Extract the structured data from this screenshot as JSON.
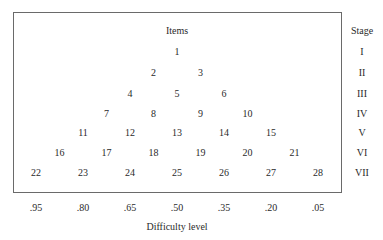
{
  "diagram": {
    "items_header": "Items",
    "stage_header": "Stage",
    "xlabel": "Difficulty level",
    "difficulty_levels": [
      ".95",
      ".80",
      ".65",
      ".50",
      ".35",
      ".20",
      ".05"
    ],
    "stages": [
      {
        "label": "I",
        "items": [
          "1"
        ]
      },
      {
        "label": "II",
        "items": [
          "2",
          "3"
        ]
      },
      {
        "label": "III",
        "items": [
          "4",
          "5",
          "6"
        ]
      },
      {
        "label": "IV",
        "items": [
          "7",
          "8",
          "9",
          "10"
        ]
      },
      {
        "label": "V",
        "items": [
          "11",
          "12",
          "13",
          "14",
          "15"
        ]
      },
      {
        "label": "VI",
        "items": [
          "16",
          "17",
          "18",
          "19",
          "20",
          "21"
        ]
      },
      {
        "label": "VII",
        "items": [
          "22",
          "23",
          "24",
          "25",
          "26",
          "27",
          "28"
        ]
      }
    ]
  }
}
